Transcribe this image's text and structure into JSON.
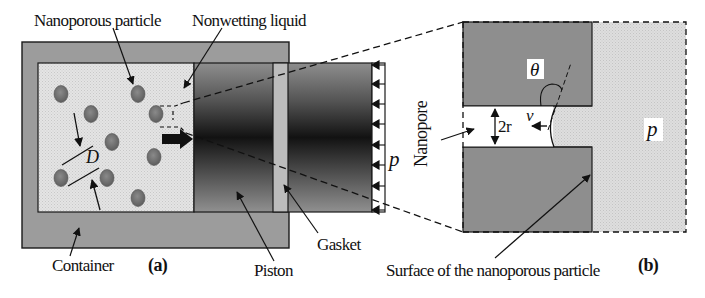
{
  "figure": {
    "panel_a": {
      "tag": "(a)",
      "labels": {
        "nanoporous_particle": "Nanoporous particle",
        "nonwetting_liquid": "Nonwetting liquid",
        "container": "Container",
        "piston": "Piston",
        "gasket": "Gasket",
        "pressure": "p",
        "diameter": "D"
      }
    },
    "panel_b": {
      "tag": "(b)",
      "labels": {
        "nanopore": "Nanopore",
        "contact_angle": "θ",
        "pore_width": "2r",
        "velocity": "v",
        "pressure": "p",
        "surface": "Surface of the nanoporous particle"
      }
    },
    "colors": {
      "container": "#9a9a9a",
      "liquid": "#e2e2e2",
      "particle": "#7e7e7e",
      "piston_dark": "#141414",
      "piston_light": "#8c8c8c",
      "gasket": "#bdbdbd",
      "solid_b": "#8e8e8e",
      "liquid_b": "#dcdcdc",
      "outline": "#1a1a1a"
    }
  }
}
